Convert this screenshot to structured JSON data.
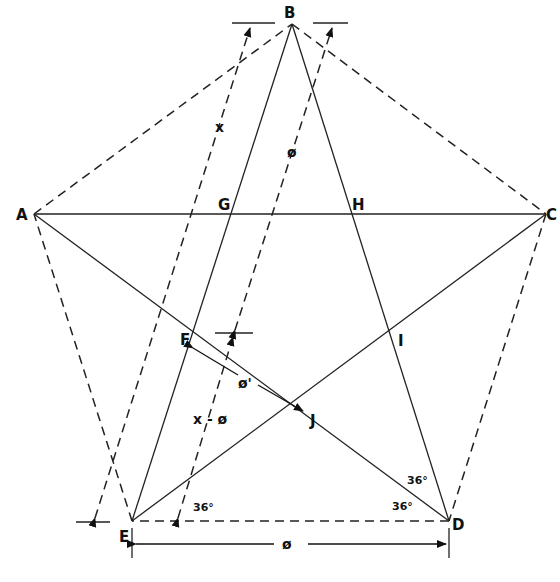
{
  "diagram": {
    "type": "geometric-construction",
    "points": {
      "A": "A",
      "B": "B",
      "C": "C",
      "D": "D",
      "E": "E",
      "F": "F",
      "G": "G",
      "H": "H",
      "I": "I",
      "J": "J"
    },
    "measurements": {
      "x": "x",
      "phi": "ø",
      "phi_prime": "ø'",
      "x_minus_phi": "x - ø",
      "base_phi": "ø"
    },
    "angles": {
      "angle_E": "36°",
      "angle_D_upper": "36°",
      "angle_D_lower": "36°"
    }
  }
}
